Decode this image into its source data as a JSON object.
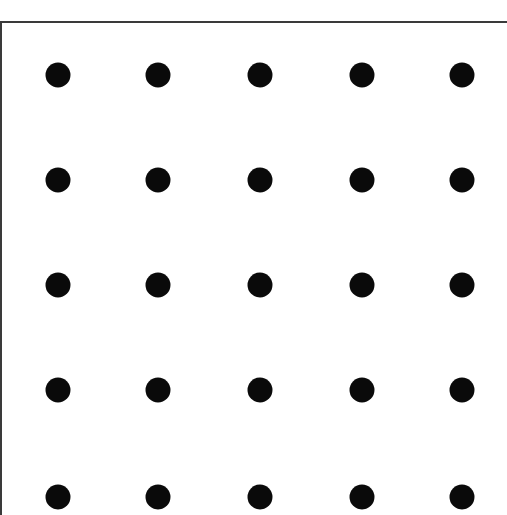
{
  "grid": {
    "rows": 5,
    "cols": 5,
    "dot_color": "#0a0a0a",
    "x_centers": [
      58,
      158,
      260,
      362,
      462
    ],
    "y_centers": [
      75,
      180,
      285,
      390,
      497
    ],
    "dot_diameter": 25
  },
  "frame": {
    "border_color": "#3a3a3a",
    "sides": [
      "top",
      "left"
    ]
  }
}
